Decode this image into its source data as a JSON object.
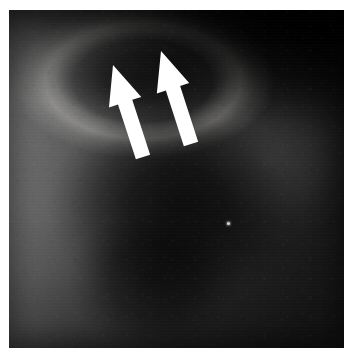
{
  "figure": {
    "kind": "radiograph",
    "modality_label": "X-ray radiograph",
    "frame": {
      "page_background": "#ffffff",
      "margin_left_px": 9,
      "margin_top_px": 10,
      "margin_right_px": 8,
      "margin_bottom_px": 12,
      "plate_width_px": 335,
      "plate_height_px": 338
    },
    "tones": {
      "left_edge": "#6a6a6a",
      "mid_field": "#3a3a3a",
      "right_edge": "#141414",
      "top_right_corner": "#050505",
      "arc_highlight": "#e6e4de",
      "deep_shadow": "#000000"
    },
    "regions": [
      {
        "name": "bright-arc",
        "description": "curved lucent band, upper centre-left"
      },
      {
        "name": "dark-lens",
        "description": "dark oval interior framed by the arc"
      },
      {
        "name": "central-mass",
        "description": "large dark visceral shadow, mid field"
      },
      {
        "name": "lower-mass",
        "description": "secondary dark blob, lower centre"
      },
      {
        "name": "right-lung-field",
        "description": "faint lighter field right of centre"
      },
      {
        "name": "left-soft-tissue",
        "description": "lighter grey column along the far left"
      },
      {
        "name": "top-right-wedge",
        "description": "near-black wedge occupying the top-right corner"
      }
    ]
  },
  "annotations": {
    "color": "#ffffff",
    "count": 2,
    "arrows": [
      {
        "id": "arrow-left",
        "label": "left annotation arrow",
        "points_to": "bright-arc",
        "direction": "up-left",
        "angle_deg": 18,
        "tip_x": 113,
        "tip_y": 65,
        "tail_x": 143,
        "tail_y": 157,
        "shaft_width_px": 15,
        "head_width_px": 34
      },
      {
        "id": "arrow-right",
        "label": "right annotation arrow",
        "points_to": "bright-arc",
        "direction": "up-left",
        "angle_deg": 18,
        "tip_x": 161,
        "tip_y": 51,
        "tail_x": 191,
        "tail_y": 144,
        "shaft_width_px": 15,
        "head_width_px": 34
      }
    ],
    "markers": [
      {
        "id": "calcific-speck",
        "label": "bright speck",
        "x": 227,
        "y": 222,
        "color": "#d8d8d4"
      }
    ]
  }
}
